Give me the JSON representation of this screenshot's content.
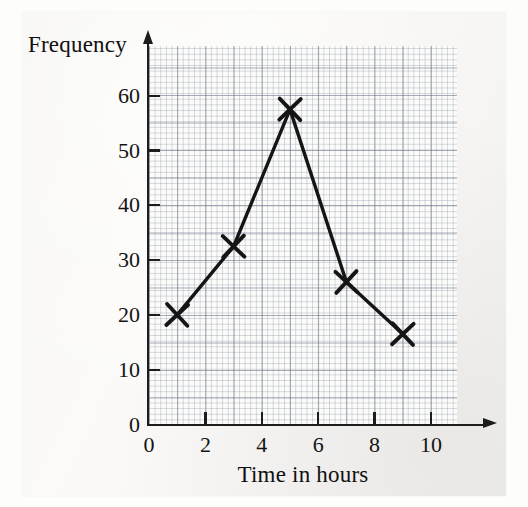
{
  "chart_data": {
    "type": "line",
    "title": "",
    "subtitle": "",
    "xlabel": "Time in hours",
    "ylabel": "Frequency",
    "x": [
      1,
      3,
      5,
      7,
      9
    ],
    "values": [
      20,
      32.5,
      57.5,
      26,
      16.5
    ],
    "series": [
      {
        "name": "Frequency polygon",
        "x": [
          1,
          3,
          5,
          7,
          9
        ],
        "values": [
          20,
          32.5,
          57.5,
          26,
          16.5
        ]
      }
    ],
    "xlim": [
      0,
      11
    ],
    "ylim": [
      0,
      69
    ],
    "xticks": [
      0,
      2,
      4,
      6,
      8,
      10
    ],
    "yticks": [
      0,
      10,
      20,
      30,
      40,
      50,
      60
    ],
    "xtick_labels": [
      "0",
      "2",
      "4",
      "6",
      "8",
      "10"
    ],
    "ytick_labels": [
      "0",
      "10",
      "20",
      "30",
      "40",
      "50",
      "60"
    ],
    "grid": true,
    "grid_style": "graph-paper",
    "legend": false,
    "legend_position": "none",
    "marker": "x-cross",
    "line_color": "#151515",
    "marker_color": "#151515",
    "grid_color": "#7a8496",
    "axis_color": "#1d1d1d",
    "paper_color": "#f7f6f4",
    "annotations": []
  },
  "axes": {
    "y_title": "Frequency",
    "x_title": "Time in hours",
    "y_arrow": "up-arrow",
    "x_arrow": "right-arrow"
  }
}
